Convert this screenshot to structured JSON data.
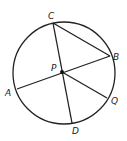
{
  "diagram": {
    "type": "circle-geometry",
    "stroke_color": "#222222",
    "background": "#ffffff",
    "circle": {
      "cx": 64,
      "cy": 73,
      "r": 51
    },
    "points": {
      "C": {
        "label": "C",
        "x": 53,
        "y": 23,
        "lx": 48,
        "ly": 19
      },
      "B": {
        "label": "B",
        "x": 110,
        "y": 56,
        "lx": 113,
        "ly": 60
      },
      "P": {
        "label": "P",
        "x": 62,
        "y": 72,
        "lx": 51,
        "ly": 71
      },
      "A": {
        "label": "A",
        "x": 17,
        "y": 89,
        "lx": 5,
        "ly": 96
      },
      "Q": {
        "label": "Q",
        "x": 107,
        "y": 98,
        "lx": 111,
        "ly": 104
      },
      "D": {
        "label": "D",
        "x": 72,
        "y": 123,
        "lx": 72,
        "ly": 134
      }
    },
    "segments": [
      {
        "from": "C",
        "to": "D"
      },
      {
        "from": "A",
        "to": "B"
      },
      {
        "from": "C",
        "to": "B"
      },
      {
        "from": "P",
        "to": "Q"
      }
    ]
  }
}
